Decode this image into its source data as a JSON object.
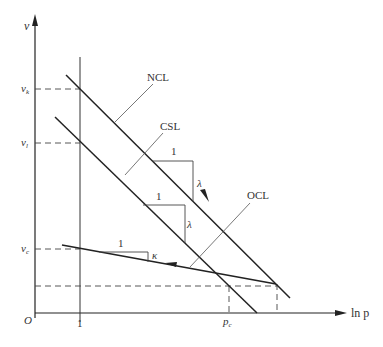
{
  "diagram": {
    "axes": {
      "y_label": "v",
      "x_label": "ln p",
      "origin_label": "O",
      "x_tick_1": "1",
      "x_tick_pc": "p",
      "x_tick_pc_sub": "c"
    },
    "y_ticks": {
      "vk": "v",
      "vk_sub": "k",
      "vl": "v",
      "vl_sub": "l",
      "vc": "v",
      "vc_sub": "c"
    },
    "lines": {
      "ncl": "NCL",
      "csl": "CSL",
      "ocl": "OCL"
    },
    "slopes": {
      "ncl_run": "1",
      "ncl_rise": "λ",
      "csl_run": "1",
      "csl_rise": "λ",
      "ocl_run": "1",
      "ocl_rise": "κ"
    },
    "colors": {
      "line": "#222222",
      "thin": "#444444",
      "text": "#333333"
    }
  }
}
